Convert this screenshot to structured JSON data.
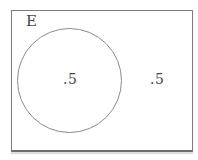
{
  "diagram": {
    "type": "venn-probability",
    "set_label": "E",
    "inside_circle_value": ".5",
    "outside_circle_value": ".5",
    "colors": {
      "background": "#ffffff",
      "rectangle_border": "#7e7e7e",
      "circle_border": "#8a8a8a",
      "text": "#464646"
    }
  }
}
